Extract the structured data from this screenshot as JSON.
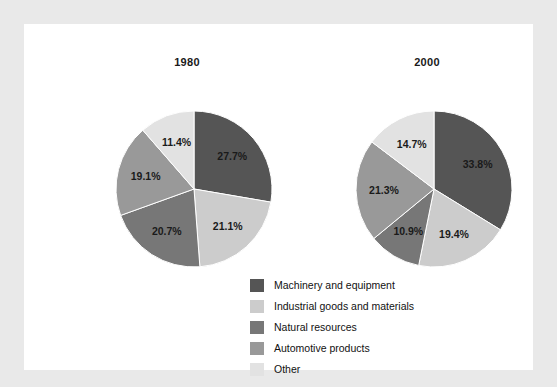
{
  "figure": {
    "background_color": "#e9e9e9",
    "panel_color": "#ffffff"
  },
  "legend": {
    "items": [
      {
        "label": "Machinery and equipment",
        "color": "#555555"
      },
      {
        "label": "Industrial goods and materials",
        "color": "#cccccc"
      },
      {
        "label": "Natural resources",
        "color": "#777777"
      },
      {
        "label": "Automotive products",
        "color": "#999999"
      },
      {
        "label": "Other",
        "color": "#e2e2e2"
      }
    ]
  },
  "chart_data": [
    {
      "type": "pie",
      "title": "1980",
      "categories": [
        "Machinery and equipment",
        "Industrial goods and materials",
        "Natural resources",
        "Automotive products",
        "Other"
      ],
      "values": [
        27.7,
        21.1,
        20.7,
        19.1,
        11.4
      ],
      "labels": [
        "27.7%",
        "21.1%",
        "20.7%",
        "19.1%",
        "11.4%"
      ],
      "colors": [
        "#555555",
        "#cccccc",
        "#777777",
        "#999999",
        "#e2e2e2"
      ],
      "start_angle_deg": 0,
      "direction": "clockwise",
      "units": "percent"
    },
    {
      "type": "pie",
      "title": "2000",
      "categories": [
        "Machinery and equipment",
        "Industrial goods and materials",
        "Natural resources",
        "Automotive products",
        "Other"
      ],
      "values": [
        33.8,
        19.4,
        10.9,
        21.3,
        14.7
      ],
      "labels": [
        "33.8%",
        "19.4%",
        "10.9%",
        "21.3%",
        "14.7%"
      ],
      "colors": [
        "#555555",
        "#cccccc",
        "#777777",
        "#999999",
        "#e2e2e2"
      ],
      "start_angle_deg": 0,
      "direction": "clockwise",
      "units": "percent"
    }
  ]
}
